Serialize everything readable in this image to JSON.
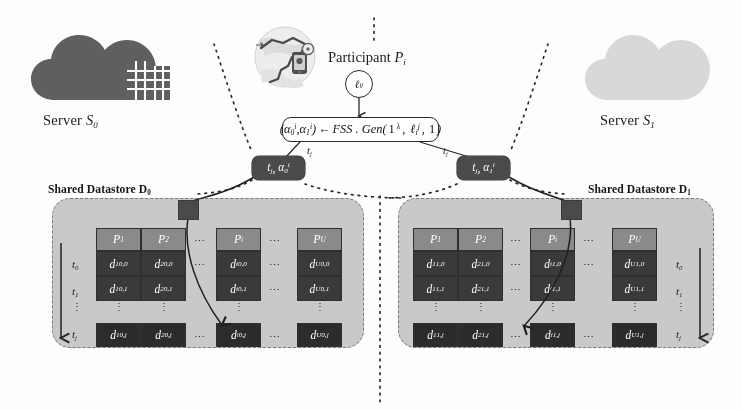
{
  "servers": [
    {
      "id": "s0",
      "caption_prefix": "Server ",
      "caption_var": "S",
      "caption_sub": "0",
      "icon": "cloud-building-icon",
      "color": "#5f5f5f"
    },
    {
      "id": "s1",
      "caption_prefix": "Server ",
      "caption_var": "S",
      "caption_sub": "1",
      "icon": "cloud-icon",
      "color": "#d0d0d0"
    }
  ],
  "participant": {
    "caption_prefix": "Participant ",
    "caption_var": "P",
    "caption_sub": "i",
    "icon": "map-trajectory-phone-icon",
    "secret_label": {
      "base": "ℓ",
      "sub": "i",
      "sup": "j"
    }
  },
  "gen_formula": {
    "lhs_open": "(",
    "alpha0": {
      "base": "α",
      "sub": "0",
      "sup": "i"
    },
    "comma": ", ",
    "alpha1": {
      "base": "α",
      "sub": "1",
      "sup": "i"
    },
    "lhs_close": ")",
    "arrow": "←",
    "fn": "FSS . Gen",
    "args_open": "(",
    "arg1_base": "1",
    "arg1_sup": "λ",
    "arg2": {
      "base": "ℓ",
      "sub": "i",
      "sup": "j"
    },
    "arg3": "1",
    "args_close": ")"
  },
  "share_nodes": [
    {
      "id": "share-left",
      "time": {
        "base": "t",
        "sub": "j"
      },
      "value": {
        "base": "α",
        "sub": "0",
        "sup": "i"
      },
      "edge_label": {
        "base": "t",
        "sub": "j"
      }
    },
    {
      "id": "share-right",
      "time": {
        "base": "t",
        "sub": "j"
      },
      "value": {
        "base": "α",
        "sub": "1",
        "sup": "i"
      },
      "edge_label": {
        "base": "t",
        "sub": "j"
      }
    }
  ],
  "datastores": [
    {
      "id": "d0",
      "caption": "Shared Datastore D",
      "caption_sub": "0",
      "share_index": "0",
      "axis_label_side": "left",
      "columns": [
        {
          "header_base": "P",
          "header_sub": "1",
          "user": "1"
        },
        {
          "header_base": "P",
          "header_sub": "2",
          "user": "2"
        },
        {
          "header_base": "P",
          "header_sub": "i",
          "user": "i"
        },
        {
          "header_base": "P",
          "header_sub": "U",
          "user": "U"
        }
      ],
      "rows": [
        {
          "label_base": "t",
          "label_sub": "0",
          "time": "0"
        },
        {
          "label_base": "t",
          "label_sub": "1",
          "time": "1"
        },
        {
          "label_base": "t",
          "label_sub": "j",
          "time": "j"
        }
      ],
      "cell_base": "d",
      "ellipsis": "⋯",
      "vellipsis": "⋮"
    },
    {
      "id": "d1",
      "caption": "Shared Datastore D",
      "caption_sub": "1",
      "share_index": "1",
      "axis_label_side": "right",
      "columns": [
        {
          "header_base": "P",
          "header_sub": "1",
          "user": "1"
        },
        {
          "header_base": "P",
          "header_sub": "2",
          "user": "2"
        },
        {
          "header_base": "P",
          "header_sub": "i",
          "user": "i"
        },
        {
          "header_base": "P",
          "header_sub": "U",
          "user": "U"
        }
      ],
      "rows": [
        {
          "label_base": "t",
          "label_sub": "0",
          "time": "0"
        },
        {
          "label_base": "t",
          "label_sub": "1",
          "time": "1"
        },
        {
          "label_base": "t",
          "label_sub": "j",
          "time": "j"
        }
      ],
      "cell_base": "d",
      "ellipsis": "⋯",
      "vellipsis": "⋮"
    }
  ],
  "colors": {
    "panel_fill": "#c9c9c9",
    "panel_border": "#7a7a7a",
    "header_cell": "#8a8a8a",
    "data_cell": "#3a3a3a",
    "node_fill": "#4b4b4b",
    "stroke": "#2b2b2b"
  }
}
